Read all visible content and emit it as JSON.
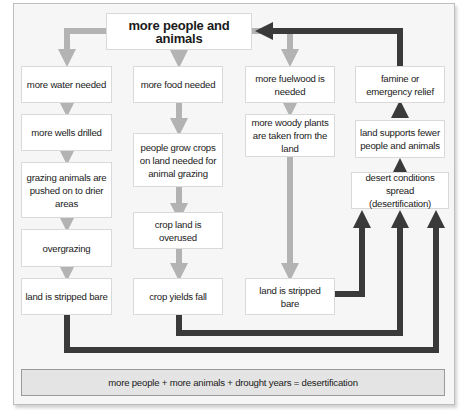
{
  "diagram": {
    "type": "flowchart",
    "topic": "desertification cycle",
    "colors": {
      "light_arrow": "#b3b3b3",
      "dark_arrow": "#3a3a3a",
      "box_fill": "#ffffff",
      "footer_fill": "#e4e4e4",
      "background": "#f6f6f6"
    },
    "top": {
      "label": "more people and animals"
    },
    "columns": [
      {
        "name": "water",
        "boxes": [
          {
            "label": "more water needed"
          },
          {
            "label": "more wells drilled"
          },
          {
            "label": "grazing animals are pushed on to drier areas"
          },
          {
            "label": "overgrazing"
          },
          {
            "label": "land is stripped bare"
          }
        ]
      },
      {
        "name": "food",
        "boxes": [
          {
            "label": "more food needed"
          },
          {
            "label": "people grow crops on land needed for animal grazing"
          },
          {
            "label": "crop land is overused"
          },
          {
            "label": "crop yields fall"
          }
        ]
      },
      {
        "name": "fuelwood",
        "boxes": [
          {
            "label": "more fuelwood is needed"
          },
          {
            "label": "more woody plants are taken from the land"
          },
          {
            "label": "land is stripped bare"
          }
        ]
      },
      {
        "name": "outcome",
        "boxes": [
          {
            "label": "famine or emergency relief"
          },
          {
            "label": "land supports fewer people and animals"
          },
          {
            "label": "desert conditions spread (desertification)"
          }
        ]
      }
    ],
    "footer": {
      "label": "more people + more animals + drought years = desertification"
    }
  }
}
